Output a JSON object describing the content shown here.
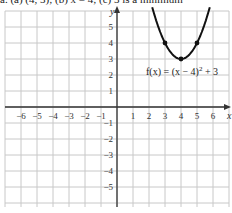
{
  "caption": "a. (a) (4, 3); (b) x = 4; (c) 3 is a minimum",
  "chart_data": {
    "type": "line",
    "title": "",
    "function_label": "f(x) = (x − 4)² + 3",
    "function_label_parts": {
      "prefix": "f(x) = (x − 4)",
      "exp": "2",
      "suffix": " + 3"
    },
    "xlabel": "x",
    "ylabel": "y",
    "xlim": [
      -7,
      7
    ],
    "ylim": [
      -6.25,
      6.25
    ],
    "grid": true,
    "x_ticks": [
      -6,
      -5,
      -4,
      -3,
      -2,
      -1,
      1,
      2,
      3,
      4,
      5,
      6
    ],
    "x_tick_labels": [
      "−6",
      "−5",
      "−4",
      "−3",
      "−2",
      "−1",
      "1",
      "2",
      "3",
      "4",
      "5",
      "6"
    ],
    "y_ticks": [
      5,
      4,
      3,
      2,
      1,
      -1,
      -2,
      -3,
      -4,
      -5
    ],
    "y_tick_labels": [
      "5",
      "4",
      "3",
      "2",
      "1",
      "−1",
      "−2",
      "−3",
      "−4",
      "−5"
    ],
    "series": [
      {
        "name": "f(x) = (x − 4)² + 3",
        "x": [
          2.15,
          2.5,
          3,
          3.5,
          4,
          4.5,
          5,
          5.5,
          5.85
        ],
        "values": [
          6.42,
          5.25,
          4,
          3.25,
          3,
          3.25,
          4,
          5.25,
          6.42
        ]
      }
    ],
    "marked_points": [
      {
        "x": 3,
        "y": 4
      },
      {
        "x": 4,
        "y": 3
      },
      {
        "x": 5,
        "y": 4
      }
    ],
    "colors": {
      "grid": "#c8c8c8",
      "axis": "#333333",
      "curve": "#111111"
    }
  }
}
